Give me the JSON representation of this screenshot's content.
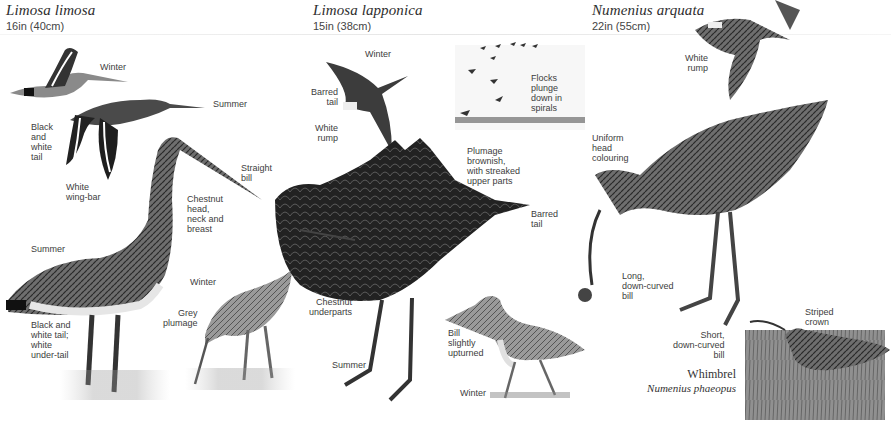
{
  "page": {
    "type": "field-guide-illustration",
    "background": "#ffffff"
  },
  "species": [
    {
      "id": "black-tailed-godwit",
      "scientific_name": "Limosa limosa",
      "size": "16in (40cm)",
      "labels": {
        "winter_flight": "Winter",
        "summer_flight": "Summer",
        "tail": "Black\nand\nwhite\ntail",
        "wing_bar": "White\nwing-bar",
        "bill": "Straight\nbill",
        "head": "Chestnut\nhead,\nneck and\nbreast",
        "summer": "Summer",
        "under_tail": "Black and\nwhite tail;\nwhite\nunder-tail",
        "winter": "Winter",
        "grey": "Grey\nplumage"
      }
    },
    {
      "id": "bar-tailed-godwit",
      "scientific_name": "Limosa lapponica",
      "size": "15in (38cm)",
      "labels": {
        "winter_flight": "Winter",
        "barred_tail_flight": "Barred\ntail",
        "white_rump": "White\nrump",
        "flocks": "Flocks\nplunge\ndown in\nspirals",
        "plumage": "Plumage\nbrownish,\nwith streaked\nupper parts",
        "barred_tail": "Barred\ntail",
        "underparts": "Chestnut\nunderparts",
        "summer": "Summer",
        "bill": "Bill\nslightly\nupturned",
        "winter": "Winter"
      }
    },
    {
      "id": "curlew",
      "scientific_name": "Numenius arquata",
      "size": "22in (55cm)",
      "labels": {
        "white_rump": "White\nrump",
        "head": "Uniform\nhead\ncolouring",
        "bill": "Long,\ndown-curved\nbill"
      }
    },
    {
      "id": "whimbrel",
      "common_name": "Whimbrel",
      "scientific_name": "Numenius phaeopus",
      "labels": {
        "crown": "Striped\ncrown",
        "bill": "Short,\ndown-curved\nbill"
      }
    }
  ]
}
